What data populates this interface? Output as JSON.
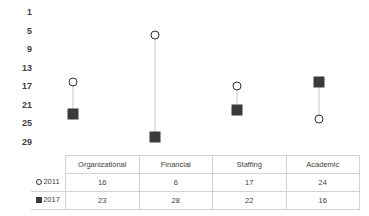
{
  "chart_data": {
    "type": "scatter",
    "title": "",
    "xlabel": "",
    "ylabel": "",
    "categories": [
      "Organizational",
      "Financial",
      "Staffing",
      "Academic"
    ],
    "series": [
      {
        "name": "2011",
        "marker": "open-circle",
        "values": [
          16,
          6,
          17,
          24
        ]
      },
      {
        "name": "2017",
        "marker": "filled-square",
        "values": [
          23,
          28,
          22,
          16
        ]
      }
    ],
    "y_ticks": [
      1,
      5,
      9,
      13,
      17,
      21,
      25,
      29
    ],
    "ylim": [
      1,
      29
    ],
    "y_axis_inverted": true,
    "grid": false,
    "legend_position": "table-row-header",
    "connectors": true
  },
  "table": {
    "corner_label": "",
    "headers": [
      "Organizational",
      "Financial",
      "Staffing",
      "Academic"
    ],
    "rows": [
      {
        "legend_label": "2011",
        "marker": "open-circle",
        "cells": [
          "16",
          "6",
          "17",
          "24"
        ]
      },
      {
        "legend_label": "2017",
        "marker": "filled-square",
        "cells": [
          "23",
          "28",
          "22",
          "16"
        ]
      }
    ]
  },
  "colors": {
    "series_2011": "#2f2f2f",
    "series_2017": "#3a3a3a",
    "connector": "#c9c9c9",
    "grid_border": "#d2d2d2",
    "text": "#404040",
    "background": "#ffffff"
  }
}
